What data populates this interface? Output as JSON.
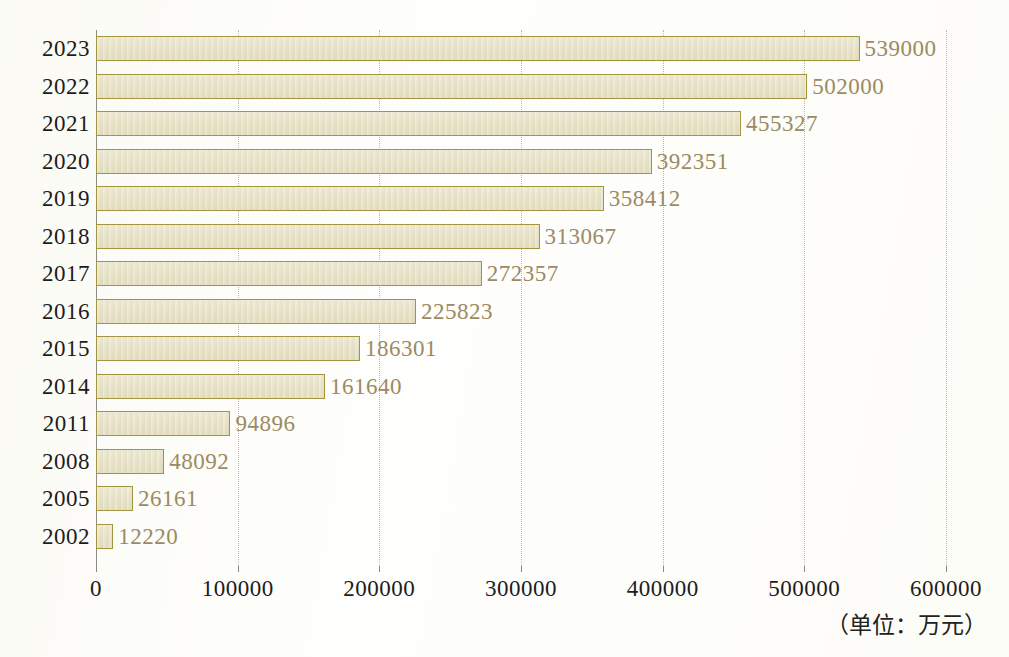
{
  "chart_data": {
    "type": "bar",
    "orientation": "horizontal",
    "title": "",
    "subtitle": "",
    "xlabel": "",
    "ylabel": "",
    "unit_note": "（单位：万元）",
    "xlim": [
      0,
      600000
    ],
    "ylim": null,
    "grid": true,
    "grid_axis": "x",
    "legend": false,
    "legend_position": "none",
    "categories": [
      "2023",
      "2022",
      "2021",
      "2020",
      "2019",
      "2018",
      "2017",
      "2016",
      "2015",
      "2014",
      "2011",
      "2008",
      "2005",
      "2002"
    ],
    "values": [
      539000,
      502000,
      455327,
      392351,
      358412,
      313067,
      272357,
      225823,
      186301,
      161640,
      94896,
      48092,
      26161,
      12220
    ],
    "data_labels": [
      "539000",
      "502000",
      "455327",
      "392351",
      "358412",
      "313067",
      "272357",
      "225823",
      "186301",
      "161640",
      "94896",
      "48092",
      "26161",
      "12220"
    ],
    "xticks": [
      0,
      100000,
      200000,
      300000,
      400000,
      500000,
      600000
    ],
    "xtick_labels": [
      "0",
      "100000",
      "200000",
      "300000",
      "400000",
      "500000",
      "600000"
    ],
    "series": [
      {
        "name": "",
        "values": [
          539000,
          502000,
          455327,
          392351,
          358412,
          313067,
          272357,
          225823,
          186301,
          161640,
          94896,
          48092,
          26161,
          12220
        ]
      }
    ],
    "colors": {
      "bar_fill": "#e6e1c6",
      "bar_border": "#a2953f",
      "data_label_text": "#9c8a63",
      "axis_text": "#1c1c1c",
      "gridline": "#b8b8b4",
      "axis_line": "#8a8a82",
      "background": "#fefefc"
    }
  }
}
